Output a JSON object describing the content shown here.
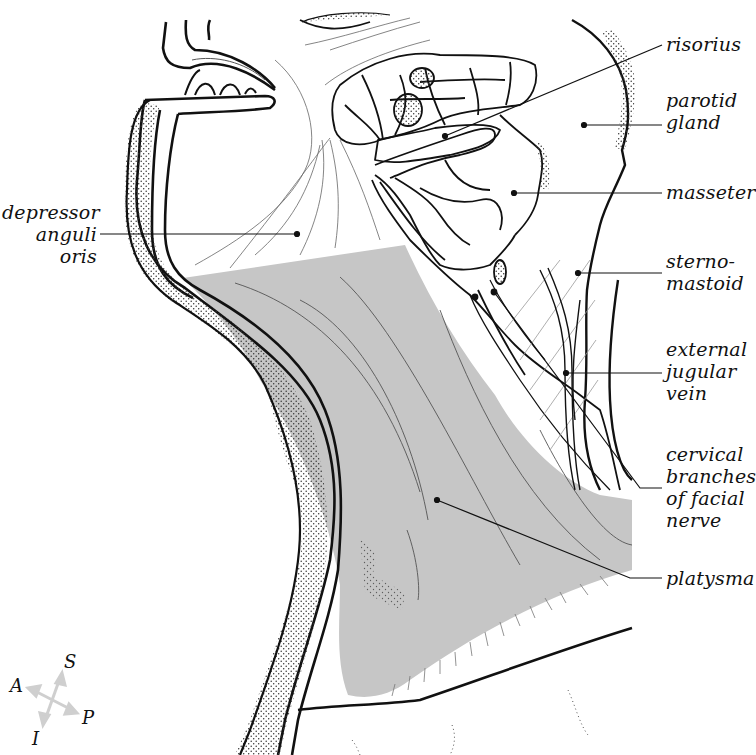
{
  "figure": {
    "fill_colors": {
      "platysma": "#c6c6c6",
      "line": "#111111",
      "stipple": "#333333",
      "orientation_arrows": "#cfcfcf"
    }
  },
  "labels": [
    {
      "id": "risorius",
      "text": "risorius"
    },
    {
      "id": "parotid-gland",
      "text": "parotid\ngland"
    },
    {
      "id": "masseter",
      "text": "masseter"
    },
    {
      "id": "depressor-anguli-oris",
      "text": "depressor\nanguli\noris"
    },
    {
      "id": "sternomastoid",
      "text": "sterno-\nmastoid"
    },
    {
      "id": "external-jugular-vein",
      "text": "external\njugular\nvein"
    },
    {
      "id": "cervical-branches-facial-nerve",
      "text": "cervical\nbranches\nof facial\nnerve"
    },
    {
      "id": "platysma",
      "text": "platysma"
    }
  ],
  "orientation": {
    "superior": "S",
    "inferior": "I",
    "anterior": "A",
    "posterior": "P"
  }
}
